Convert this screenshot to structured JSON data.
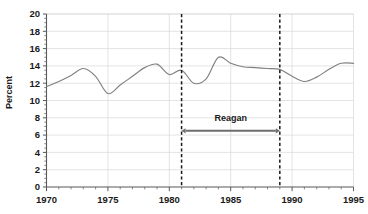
{
  "chart_data": {
    "type": "line",
    "title": "",
    "xlabel": "",
    "ylabel": "Percent",
    "xlim": [
      1970,
      1995
    ],
    "ylim": [
      0,
      20
    ],
    "ytick_step": 2,
    "xtick_step": 5,
    "y_minor_step": 0.5,
    "x_minor_step": 1,
    "grid": true,
    "grid_axis": "both",
    "legend": "none",
    "xticks": [
      1970,
      1975,
      1980,
      1985,
      1990,
      1995
    ],
    "yticks": [
      0,
      2,
      4,
      6,
      8,
      10,
      12,
      14,
      16,
      18,
      20
    ],
    "series": [
      {
        "name": "Percent",
        "color": "#808080",
        "x": [
          1970,
          1971,
          1972,
          1973,
          1974,
          1975,
          1976,
          1977,
          1978,
          1979,
          1980,
          1981,
          1982,
          1983,
          1984,
          1985,
          1986,
          1987,
          1988,
          1989,
          1990,
          1991,
          1992,
          1993,
          1994,
          1995
        ],
        "values": [
          11.6,
          12.2,
          12.9,
          13.7,
          12.8,
          10.8,
          11.8,
          12.8,
          13.8,
          14.2,
          13.0,
          13.5,
          12.0,
          12.5,
          15.0,
          14.3,
          13.9,
          13.8,
          13.7,
          13.6,
          12.8,
          12.2,
          12.7,
          13.6,
          14.3,
          14.3
        ]
      }
    ],
    "annotations": [
      {
        "name": "reagan-span",
        "label": "Reagan",
        "x_start": 1981,
        "x_end": 1989,
        "y": 6.5,
        "label_y": 7.6,
        "style": "double-arrow",
        "color": "#6e6e6e"
      },
      {
        "name": "term-start-line",
        "label": "",
        "x": 1981,
        "style": "dashed-vertical",
        "color": "#1a1a1a"
      },
      {
        "name": "term-end-line",
        "label": "",
        "x": 1989,
        "style": "dashed-vertical",
        "color": "#1a1a1a"
      }
    ],
    "colors": {
      "line": "#808080",
      "axis": "#595959",
      "grid": "#d9d9d9",
      "text": "#1a1a1a",
      "annotation": "#6e6e6e",
      "background": "#ffffff"
    }
  }
}
